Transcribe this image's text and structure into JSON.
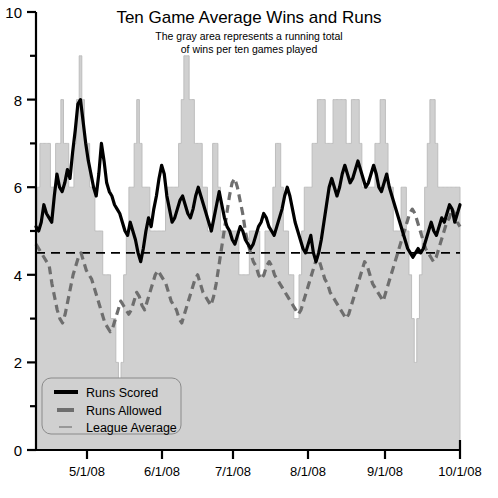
{
  "chart_data": {
    "type": "line",
    "title": "Ten Game Average Wins and Runs",
    "subtitle_line1": "The gray area represents a running total",
    "subtitle_line2": "of wins per ten games played",
    "xlabel": "",
    "ylabel": "",
    "ylim": [
      0,
      10
    ],
    "y_major_ticks": [
      0,
      2,
      4,
      6,
      8,
      10
    ],
    "y_major_tick_labels": [
      "0",
      "2",
      "4",
      "6",
      "8",
      "10"
    ],
    "y_minor_ticks": [
      1,
      3,
      5,
      7,
      9
    ],
    "x_tick_labels": [
      "5/1/08",
      "6/1/08",
      "7/1/08",
      "8/1/08",
      "9/1/08",
      "10/1/08"
    ],
    "x_tick_positions": [
      87,
      162,
      233,
      308,
      385,
      460
    ],
    "grid": false,
    "legend_position": "bottom-left",
    "colors": {
      "area_fill": "#d0d0d0",
      "area_stroke": "#bdbdbd",
      "runs_scored": "#000000",
      "runs_allowed": "#6e6e6e",
      "league_average": "#000000",
      "axis": "#000000",
      "legend_bg": "#d0d0d0",
      "legend_border": "#8a8a8a"
    },
    "series": [
      {
        "name": "Wins per Ten Games",
        "type": "area",
        "values": [
          5.0,
          6.0,
          7.0,
          7.0,
          7.0,
          7.0,
          6.0,
          6.0,
          7.0,
          7.0,
          8.0,
          7.0,
          7.0,
          6.0,
          6.0,
          7.0,
          8.0,
          9.0,
          8.0,
          7.0,
          7.0,
          6.0,
          6.0,
          5.0,
          5.0,
          5.0,
          4.0,
          4.0,
          4.0,
          3.0,
          3.0,
          2.0,
          1.0,
          2.0,
          4.0,
          5.0,
          6.0,
          6.0,
          7.0,
          8.0,
          7.0,
          6.0,
          6.0,
          6.0,
          5.0,
          5.0,
          5.0,
          5.0,
          5.0,
          5.0,
          6.0,
          6.0,
          6.0,
          6.0,
          6.0,
          7.0,
          8.0,
          9.0,
          9.0,
          8.0,
          8.0,
          7.0,
          7.0,
          7.0,
          6.0,
          6.0,
          5.0,
          5.0,
          7.0,
          7.0,
          6.0,
          5.0,
          5.0,
          5.0,
          5.0,
          5.0,
          5.0,
          5.0,
          4.0,
          4.0,
          4.0,
          4.0,
          5.0,
          5.0,
          5.0,
          5.0,
          4.0,
          4.0,
          5.0,
          5.0,
          5.0,
          6.0,
          7.0,
          7.0,
          6.0,
          5.0,
          5.0,
          4.0,
          4.0,
          3.0,
          3.0,
          4.0,
          5.0,
          6.0,
          6.0,
          6.0,
          7.0,
          7.0,
          8.0,
          8.0,
          8.0,
          7.0,
          7.0,
          7.0,
          8.0,
          8.0,
          8.0,
          8.0,
          8.0,
          7.0,
          7.0,
          8.0,
          8.0,
          8.0,
          7.0,
          6.0,
          6.0,
          6.0,
          6.0,
          6.0,
          7.0,
          7.0,
          8.0,
          8.0,
          7.0,
          6.0,
          6.0,
          5.0,
          5.0,
          5.0,
          6.0,
          6.0,
          5.0,
          4.0,
          3.0,
          2.0,
          3.0,
          4.0,
          5.0,
          6.0,
          7.0,
          8.0,
          8.0,
          7.0,
          6.0,
          6.0,
          6.0,
          6.0,
          6.0,
          6.0,
          6.0,
          6.0,
          6.0
        ]
      },
      {
        "name": "Runs Scored",
        "type": "line",
        "style": "solid",
        "values": [
          5.1,
          5.0,
          5.2,
          5.6,
          5.4,
          5.3,
          5.2,
          5.8,
          6.3,
          6.0,
          5.9,
          6.1,
          6.4,
          6.2,
          6.8,
          7.3,
          7.9,
          8.0,
          7.5,
          7.0,
          6.6,
          6.3,
          6.0,
          5.8,
          6.3,
          7.0,
          6.6,
          6.1,
          5.9,
          5.8,
          5.6,
          5.5,
          5.4,
          5.2,
          5.0,
          4.9,
          5.2,
          5.0,
          4.8,
          4.5,
          4.3,
          4.6,
          5.0,
          5.3,
          5.1,
          5.5,
          5.8,
          6.2,
          6.5,
          6.3,
          5.8,
          5.5,
          5.2,
          5.3,
          5.5,
          5.7,
          5.8,
          5.6,
          5.4,
          5.3,
          5.5,
          5.8,
          6.0,
          5.8,
          5.6,
          5.4,
          5.2,
          5.0,
          5.3,
          5.6,
          5.9,
          5.6,
          5.3,
          5.1,
          5.0,
          4.8,
          4.7,
          4.9,
          5.1,
          5.0,
          4.8,
          4.7,
          4.6,
          4.7,
          4.9,
          5.1,
          5.2,
          5.4,
          5.3,
          5.1,
          5.0,
          4.9,
          5.1,
          5.3,
          5.5,
          5.8,
          6.0,
          5.8,
          5.5,
          5.2,
          5.0,
          4.8,
          4.6,
          4.5,
          4.7,
          4.9,
          4.5,
          4.3,
          4.5,
          4.8,
          5.2,
          5.6,
          6.0,
          6.2,
          6.0,
          5.8,
          6.0,
          6.3,
          6.5,
          6.3,
          6.1,
          6.2,
          6.4,
          6.6,
          6.4,
          6.2,
          6.0,
          6.1,
          6.3,
          6.5,
          6.3,
          6.0,
          5.9,
          6.1,
          6.3,
          6.0,
          5.8,
          5.6,
          5.4,
          5.2,
          5.0,
          4.8,
          4.6,
          4.5,
          4.4,
          4.5,
          4.6,
          4.5,
          4.6,
          4.8,
          5.0,
          5.2,
          5.0,
          4.9,
          5.1,
          5.3,
          5.2,
          5.4,
          5.6,
          5.5,
          5.2,
          5.4,
          5.6
        ]
      },
      {
        "name": "Runs Allowed",
        "type": "line",
        "style": "dashed",
        "values": [
          4.7,
          4.6,
          4.5,
          4.4,
          4.3,
          4.2,
          3.8,
          3.5,
          3.2,
          3.0,
          2.9,
          3.1,
          3.4,
          3.7,
          4.0,
          4.2,
          4.4,
          4.5,
          4.3,
          4.1,
          4.0,
          3.9,
          3.7,
          3.5,
          3.3,
          3.1,
          2.9,
          2.8,
          2.7,
          2.8,
          3.0,
          3.2,
          3.4,
          3.3,
          3.2,
          3.1,
          3.2,
          3.4,
          3.6,
          3.5,
          3.3,
          3.2,
          3.4,
          3.6,
          3.8,
          4.0,
          4.1,
          4.0,
          3.9,
          3.8,
          3.6,
          3.4,
          3.3,
          3.2,
          3.0,
          2.9,
          3.1,
          3.3,
          3.5,
          3.7,
          3.9,
          4.0,
          3.8,
          3.6,
          3.5,
          3.4,
          3.3,
          3.5,
          3.8,
          4.2,
          4.6,
          5.0,
          5.4,
          5.8,
          6.1,
          6.2,
          6.0,
          5.7,
          5.4,
          5.0,
          4.7,
          4.5,
          4.3,
          4.2,
          4.0,
          3.9,
          4.0,
          4.2,
          4.3,
          4.2,
          4.0,
          3.9,
          3.8,
          3.7,
          3.6,
          3.5,
          3.4,
          3.3,
          3.2,
          3.1,
          3.2,
          3.4,
          3.6,
          3.8,
          4.0,
          4.2,
          4.4,
          4.3,
          4.1,
          3.9,
          3.8,
          3.6,
          3.5,
          3.4,
          3.3,
          3.2,
          3.1,
          3.0,
          3.1,
          3.3,
          3.5,
          3.7,
          3.9,
          4.1,
          4.3,
          4.2,
          4.0,
          3.8,
          3.7,
          3.6,
          3.5,
          3.4,
          3.6,
          3.8,
          4.0,
          4.2,
          4.4,
          4.6,
          4.8,
          5.0,
          5.2,
          5.4,
          5.5,
          5.4,
          5.2,
          5.0,
          4.8,
          4.6,
          4.5,
          4.4,
          4.3,
          4.4,
          4.6,
          4.8,
          5.0,
          5.2,
          5.3,
          5.5,
          5.4,
          5.2,
          5.1
        ]
      },
      {
        "name": "League Average",
        "type": "hline",
        "style": "dashed",
        "value": 4.5
      }
    ]
  },
  "legend": {
    "items": [
      {
        "label": "Runs Scored",
        "marker": "thick-solid-black"
      },
      {
        "label": "Runs Allowed",
        "marker": "thick-dashed-gray"
      },
      {
        "label": "League Average",
        "marker": "thin-solid-gray"
      }
    ]
  }
}
